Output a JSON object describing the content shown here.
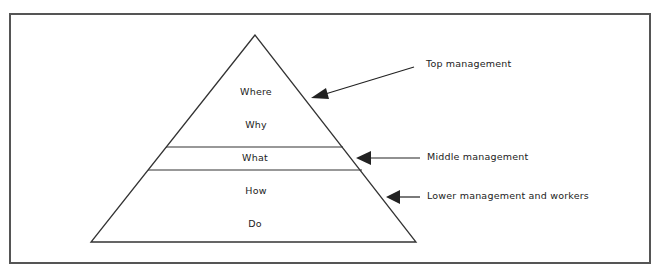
{
  "pyramid": {
    "tiers": [
      {
        "label": "Where"
      },
      {
        "label": "Why"
      },
      {
        "label": "What"
      },
      {
        "label": "How"
      },
      {
        "label": "Do"
      }
    ]
  },
  "annotations": [
    {
      "label": "Top management"
    },
    {
      "label": "Middle management"
    },
    {
      "label": "Lower management and workers"
    }
  ],
  "colors": {
    "line": "#333333",
    "text": "#222222",
    "frame": "#555555",
    "background": "#ffffff"
  }
}
